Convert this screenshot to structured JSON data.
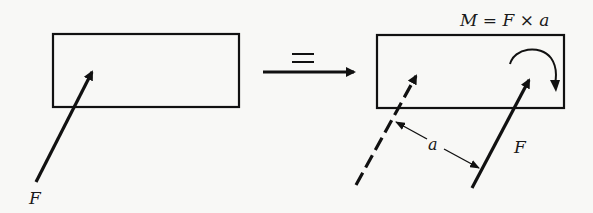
{
  "diagram": {
    "type": "force-couple-equivalence",
    "left_panel": {
      "body": "rectangle",
      "force": {
        "label": "F",
        "direction": "up-right, acting into body"
      }
    },
    "equivalence": {
      "symbol": "="
    },
    "right_panel": {
      "body": "rectangle",
      "moment_label": "M = F × a",
      "original_force_line": {
        "style": "dashed",
        "label": ""
      },
      "translated_force": {
        "label": "F",
        "style": "solid"
      },
      "moment_arrow": {
        "direction": "clockwise"
      },
      "distance": {
        "label": "a"
      }
    }
  },
  "colors": {
    "ink": "#111111",
    "background": "#f8f8f6"
  }
}
